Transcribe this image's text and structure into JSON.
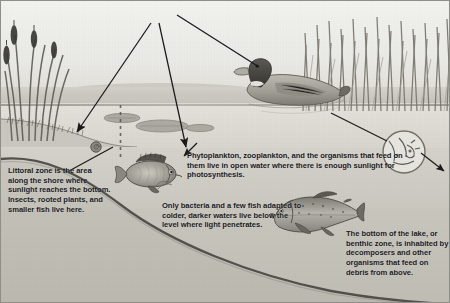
{
  "diagram": {
    "width": 450,
    "height": 303,
    "colors": {
      "ink": "#17171a",
      "sky": "#f2f2ef",
      "water_upper": "#e3e1db",
      "water_deep": "#c0bdb5",
      "lakebed": "#4a4843",
      "arrow": "#1a1a1c"
    }
  },
  "labels": {
    "sunlight": "Sunlight"
  },
  "callouts": [
    {
      "id": "littoral",
      "heading": "Littoral zone",
      "body": " is the area along the shore where sunlight reaches the bottom. Insects, rooted plants, and smaller fish live here.",
      "full_text": "Littoral zone is the area along the shore where sunlight reaches the bottom. Insects, rooted plants, and smaller fish live here."
    },
    {
      "id": "plankton",
      "heading": "",
      "body": "Phytoplankton, zooplankton, and the organisms that feed on them live in open water where there is enough sunlight for photosynthesis.",
      "full_text": "Phytoplankton, zooplankton, and the organisms that feed on them live in open water where there is enough sunlight for photosynthesis."
    },
    {
      "id": "deepfish",
      "heading": "",
      "body": "Only bacteria and a few fish adapted to colder, darker waters live below the level where light penetrates.",
      "full_text": "Only bacteria and a few fish adapted to colder, darker waters live below the level where light penetrates."
    },
    {
      "id": "benthic",
      "heading": "benthic zone",
      "body_before": "The bottom of the lake, or ",
      "body_after": ", is inhabited by decomposers and other organisms that feed on debris from above.",
      "full_text": "The bottom of the lake, or benthic zone, is inhabited by decomposers and other organisms that feed on debris from above."
    }
  ],
  "scene": {
    "organisms": [
      {
        "name": "mallard-duck",
        "zone": "surface"
      },
      {
        "name": "sunfish",
        "zone": "littoral"
      },
      {
        "name": "trout",
        "zone": "deep-water"
      },
      {
        "name": "plankton-magnifier-inset",
        "zone": "open-water"
      },
      {
        "name": "snail",
        "zone": "littoral"
      }
    ],
    "vegetation": [
      {
        "name": "cattails",
        "position": "left-shore"
      },
      {
        "name": "reeds",
        "position": "right-shore"
      },
      {
        "name": "lily-pads",
        "position": "water-surface"
      }
    ],
    "zones": [
      "littoral zone",
      "open water",
      "deep water",
      "benthic zone"
    ]
  }
}
